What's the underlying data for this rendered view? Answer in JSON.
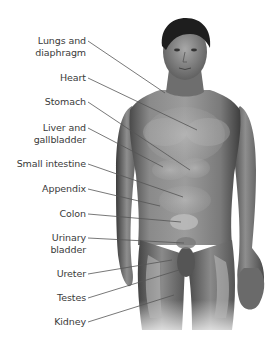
{
  "diagram": {
    "labels": [
      {
        "line1": "Lungs and",
        "line2": "diaphragm",
        "y": 35,
        "line_from": [
          88,
          41
        ],
        "line_to": [
          165,
          93
        ]
      },
      {
        "line1": "Heart",
        "line2": "",
        "y": 72,
        "line_from": [
          88,
          78
        ],
        "line_to": [
          197,
          130
        ]
      },
      {
        "line1": "Stomach",
        "line2": "",
        "y": 96,
        "line_from": [
          88,
          102
        ],
        "line_to": [
          190,
          170
        ]
      },
      {
        "line1": "Liver and",
        "line2": "gallbladder",
        "y": 122,
        "line_from": [
          88,
          128
        ],
        "line_to": [
          163,
          167
        ]
      },
      {
        "line1": "Small intestine",
        "line2": "",
        "y": 158,
        "line_from": [
          88,
          164
        ],
        "line_to": [
          183,
          197
        ]
      },
      {
        "line1": "Appendix",
        "line2": "",
        "y": 183,
        "line_from": [
          88,
          189
        ],
        "line_to": [
          160,
          206
        ]
      },
      {
        "line1": "Colon",
        "line2": "",
        "y": 208,
        "line_from": [
          88,
          214
        ],
        "line_to": [
          181,
          222
        ]
      },
      {
        "line1": "Urinary",
        "line2": "bladder",
        "y": 232,
        "line_from": [
          88,
          238
        ],
        "line_to": [
          184,
          243
        ]
      },
      {
        "line1": "Ureter",
        "line2": "",
        "y": 268,
        "line_from": [
          88,
          274
        ],
        "line_to": [
          172,
          260
        ]
      },
      {
        "line1": "Testes",
        "line2": "",
        "y": 292,
        "line_from": [
          88,
          298
        ],
        "line_to": [
          179,
          270
        ]
      },
      {
        "line1": "Kidney",
        "line2": "",
        "y": 316,
        "line_from": [
          88,
          322
        ],
        "line_to": [
          174,
          295
        ]
      }
    ],
    "colors": {
      "skin_dark": "#4a4a4a",
      "skin_mid": "#8a8a8a",
      "skin_light": "#c4c4c4",
      "organ_highlight": "#b8b8b8",
      "leader_line": "#555555",
      "label_text": "#3a3a3a",
      "hair": "#1e1e1e"
    }
  }
}
